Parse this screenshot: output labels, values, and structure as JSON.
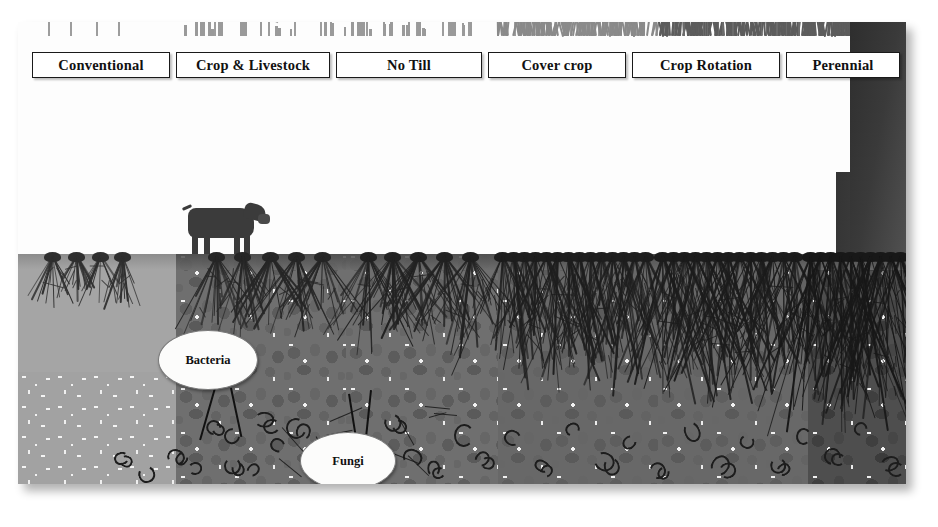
{
  "figure": {
    "type": "scientific-illustration-diagram",
    "background_color": "#ffffff",
    "panel": {
      "x": 18,
      "y": 22,
      "width": 888,
      "height": 462,
      "has_drop_shadow": true
    }
  },
  "top_labels": [
    {
      "id": "conventional",
      "label": "Conventional",
      "x": 32,
      "width": 136
    },
    {
      "id": "crop-livestock",
      "label": "Crop & Livestock",
      "x": 176,
      "width": 152
    },
    {
      "id": "no-till",
      "label": "No Till",
      "x": 336,
      "width": 144
    },
    {
      "id": "cover-crop",
      "label": "Cover crop",
      "x": 488,
      "width": 136
    },
    {
      "id": "crop-rotation",
      "label": "Crop Rotation",
      "x": 632,
      "width": 146
    },
    {
      "id": "perennial",
      "label": "Perennial",
      "x": 786,
      "width": 112
    }
  ],
  "callouts": [
    {
      "id": "bacteria",
      "label": "Bacteria",
      "x": 158,
      "y": 330,
      "w": 98,
      "h": 58
    },
    {
      "id": "fungi",
      "label": "Fungi",
      "x": 300,
      "y": 432,
      "w": 94,
      "h": 56
    }
  ],
  "scene": {
    "sky_color": "#fdfdfd",
    "soil_surface_y": 258,
    "zones": [
      {
        "id": "conventional",
        "x": 0,
        "width": 158,
        "soil_color": "#a6a6a6",
        "structure": "compacted-fine",
        "vegetation": "tall corn",
        "roots": "shallow sparse"
      },
      {
        "id": "crop-livestock",
        "x": 158,
        "width": 170,
        "soil_color": "#6f6f6f",
        "structure": "aggregated",
        "vegetation": "tall corn with grazing cattle",
        "roots": "moderate"
      },
      {
        "id": "no-till",
        "x": 328,
        "width": 152,
        "soil_color": "#6f6f6f",
        "structure": "aggregated",
        "vegetation": "tall corn with residue",
        "roots": "moderate-deep"
      },
      {
        "id": "cover-crop",
        "x": 480,
        "width": 160,
        "soil_color": "#686868",
        "structure": "well-aggregated",
        "vegetation": "corn plus dense cover crop",
        "roots": "dense fibrous"
      },
      {
        "id": "crop-rotation",
        "x": 640,
        "width": 150,
        "soil_color": "#686868",
        "structure": "well-aggregated",
        "vegetation": "mixed rotation crops",
        "roots": "dense deep"
      },
      {
        "id": "perennial",
        "x": 790,
        "width": 98,
        "soil_color": "#4e4e4e",
        "structure": "highly-aggregated dark",
        "vegetation": "perennial grass and tree",
        "roots": "deep extensive"
      }
    ],
    "organisms": {
      "bacteria_present": true,
      "fungi_present": true,
      "earthworms_visible": true
    },
    "livestock": {
      "type": "cow",
      "count": 1,
      "zone": "crop-livestock"
    },
    "tree": {
      "type": "trunk",
      "zone": "perennial",
      "color": "#343434"
    }
  },
  "legend_note": ""
}
